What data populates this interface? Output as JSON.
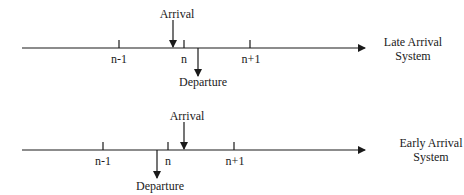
{
  "diagrams": [
    {
      "system_label_line1": "Late Arrival",
      "system_label_line2": "System",
      "ticks": [
        "n-1",
        "n",
        "n+1"
      ],
      "arrival_label": "Arrival",
      "departure_label": "Departure"
    },
    {
      "system_label_line1": "Early Arrival",
      "system_label_line2": "System",
      "ticks": [
        "n-1",
        "n",
        "n+1"
      ],
      "arrival_label": "Arrival",
      "departure_label": "Departure"
    }
  ],
  "colors": {
    "stroke": "#1a1a1a",
    "background": "#ffffff"
  }
}
